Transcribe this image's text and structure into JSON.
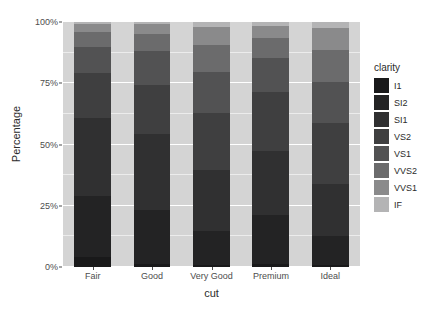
{
  "chart_data": {
    "type": "bar",
    "title": "",
    "subtitle": "",
    "stacked": true,
    "stack_normalized": true,
    "xlabel": "cut",
    "ylabel": "Percentage",
    "categories": [
      "Fair",
      "Good",
      "Very Good",
      "Premium",
      "Ideal"
    ],
    "ytick_labels": [
      "0%",
      "25%",
      "50%",
      "75%",
      "100%"
    ],
    "ytick_values": [
      0,
      25,
      50,
      75,
      100
    ],
    "ylim": [
      0,
      100
    ],
    "grid": true,
    "legend_position": "right",
    "legend_title": "clarity",
    "series": [
      {
        "name": "I1",
        "color": "#19191a",
        "values": [
          4.0,
          1.2,
          0.8,
          1.4,
          0.7
        ]
      },
      {
        "name": "SI2",
        "color": "#232324",
        "values": [
          25.0,
          22.0,
          14.0,
          20.0,
          12.0
        ]
      },
      {
        "name": "SI1",
        "color": "#303031",
        "values": [
          32.0,
          31.0,
          25.0,
          26.0,
          21.0
        ]
      },
      {
        "name": "VS2",
        "color": "#3f3f40",
        "values": [
          18.0,
          20.0,
          23.0,
          24.0,
          25.0
        ]
      },
      {
        "name": "VS1",
        "color": "#525253",
        "values": [
          11.0,
          14.0,
          17.0,
          14.0,
          17.0
        ]
      },
      {
        "name": "VVS2",
        "color": "#6b6b6c",
        "values": [
          6.0,
          7.0,
          11.0,
          8.0,
          13.0
        ]
      },
      {
        "name": "VVS1",
        "color": "#8a8a8b",
        "values": [
          3.0,
          4.0,
          7.0,
          5.0,
          9.0
        ]
      },
      {
        "name": "IF",
        "color": "#b4b4b5",
        "values": [
          1.0,
          0.8,
          2.2,
          1.6,
          2.3
        ]
      }
    ]
  },
  "panel": {
    "background_color": "#d4d4d4",
    "gridline_color": "#ffffff"
  }
}
